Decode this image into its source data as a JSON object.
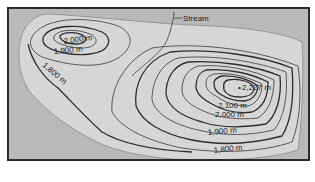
{
  "map": {
    "type": "topographic contour map",
    "colors": {
      "background": "#b9b9b9",
      "land": "#d6d6d6",
      "contour": "#2d2d2d",
      "frame": "#2a2a2a"
    },
    "labels": {
      "stream": "Stream",
      "west_peak_2000": "2,000 m",
      "west_1900": "1,900 m",
      "west_1800": "1,800 m",
      "summit": "2,227 m",
      "east_2100": "2,100 m",
      "east_2000": "2,000 m",
      "east_1900": "1,900 m",
      "east_1800": "1,800 m"
    },
    "summit_marker": "•"
  }
}
